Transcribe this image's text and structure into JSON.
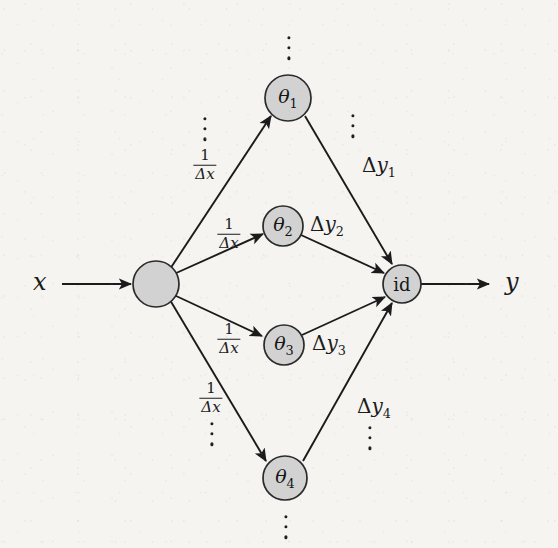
{
  "diagram": {
    "background_color": "#f5f4f1",
    "ink_color": "#1b1b1b",
    "node_fill": "#d2d2d2",
    "input": {
      "label": "x"
    },
    "output": {
      "label": "y"
    },
    "hub": {
      "label": ""
    },
    "sink": {
      "label": "id"
    },
    "theta_nodes": [
      {
        "label": "θ",
        "index": "1"
      },
      {
        "label": "θ",
        "index": "2"
      },
      {
        "label": "θ",
        "index": "3"
      },
      {
        "label": "θ",
        "index": "4"
      }
    ],
    "in_edge_labels": [
      {
        "numerator": "1",
        "denominator": "Δx"
      },
      {
        "numerator": "1",
        "denominator": "Δx"
      },
      {
        "numerator": "1",
        "denominator": "Δx"
      },
      {
        "numerator": "1",
        "denominator": "Δx"
      }
    ],
    "out_edge_labels": [
      {
        "delta": "Δ",
        "var": "y",
        "index": "1"
      },
      {
        "delta": "Δ",
        "var": "y",
        "index": "2"
      },
      {
        "delta": "Δ",
        "var": "y",
        "index": "3"
      },
      {
        "delta": "Δ",
        "var": "y",
        "index": "4"
      }
    ],
    "ellipses_count": 7
  }
}
